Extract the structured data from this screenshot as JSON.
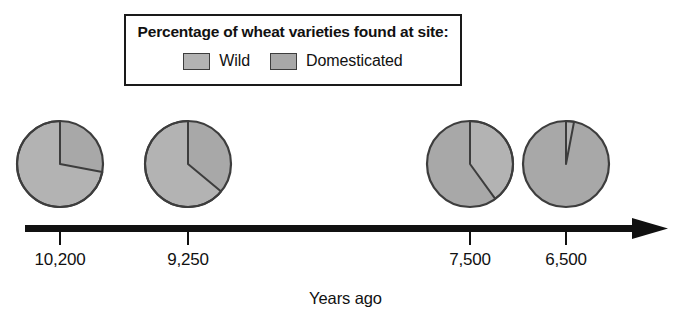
{
  "legend": {
    "title": "Percentage of wheat varieties found at site:",
    "entries": [
      {
        "label": "Wild",
        "color": "#b3b3b3",
        "icon": "legend-swatch-icon"
      },
      {
        "label": "Domesticated",
        "color": "#a8a8a8",
        "icon": "legend-swatch-icon"
      }
    ]
  },
  "axis": {
    "title": "Years ago",
    "arrow_icon": "arrow-right-icon",
    "ticks": [
      "10,200",
      "9,250",
      "7,500",
      "6,500"
    ]
  },
  "colors": {
    "wild": "#b3b3b3",
    "domesticated": "#a8a8a8",
    "outline": "#3d3d3d",
    "axis": "#111111",
    "background": "#ffffff"
  },
  "chart_data": {
    "type": "pie",
    "title": "Percentage of wheat varieties found at site:",
    "xlabel": "Years ago",
    "ylabel": "",
    "categories": [
      "Wild",
      "Domesticated"
    ],
    "legend_position": "top",
    "grid": false,
    "note": "Four pie charts placed along a timeline arrow; each pie splits 100% between Wild and Domesticated wheat varieties.",
    "pies": [
      {
        "label": "10,200",
        "cx": 60,
        "cy": 164,
        "r": 43,
        "slices": [
          {
            "name": "Wild",
            "percent": 72,
            "color": "#b3b3b3"
          },
          {
            "name": "Domesticated",
            "percent": 28,
            "color": "#a8a8a8"
          }
        ]
      },
      {
        "label": "9,250",
        "cx": 188,
        "cy": 164,
        "r": 43,
        "slices": [
          {
            "name": "Wild",
            "percent": 64,
            "color": "#b3b3b3"
          },
          {
            "name": "Domesticated",
            "percent": 36,
            "color": "#a8a8a8"
          }
        ]
      },
      {
        "label": "7,500",
        "cx": 470,
        "cy": 164,
        "r": 43,
        "slices": [
          {
            "name": "Wild",
            "percent": 40,
            "color": "#b3b3b3"
          },
          {
            "name": "Domesticated",
            "percent": 60,
            "color": "#a8a8a8"
          }
        ]
      },
      {
        "label": "6,500",
        "cx": 566,
        "cy": 164,
        "r": 43,
        "slices": [
          {
            "name": "Wild",
            "percent": 3,
            "color": "#b3b3b3"
          },
          {
            "name": "Domesticated",
            "percent": 97,
            "color": "#a8a8a8"
          }
        ]
      }
    ],
    "tick_positions_px": [
      60,
      188,
      470,
      566
    ]
  }
}
